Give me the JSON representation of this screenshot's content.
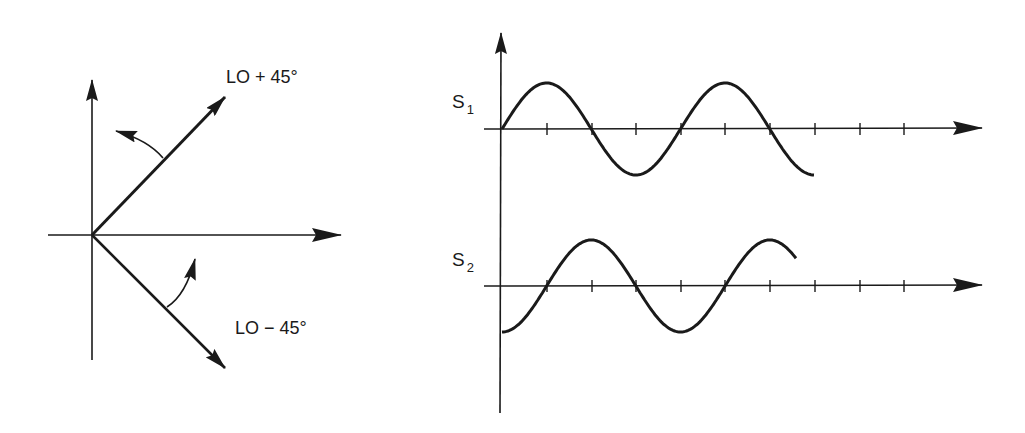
{
  "phasor_diagram": {
    "upper_vector_label": "LO + 45°",
    "lower_vector_label": "LO − 45°"
  },
  "waveforms": {
    "s1": {
      "label_main": "S",
      "label_sub": "1",
      "shape": "sine",
      "cycles": 1.75
    },
    "s2": {
      "label_main": "S",
      "label_sub": "2",
      "shape": "negative-cosine",
      "cycles": 1.65
    },
    "tick_count": 9
  },
  "colors": {
    "ink": "#1a1a1a",
    "background": "#ffffff"
  }
}
